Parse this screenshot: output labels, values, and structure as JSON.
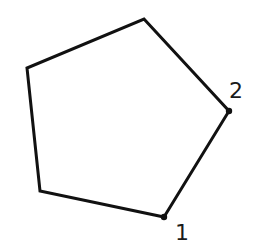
{
  "diagram": {
    "shape": "pentagon",
    "stroke_color": "#111111",
    "background": "#ffffff",
    "vertices": [
      {
        "x": 164,
        "y": 217
      },
      {
        "x": 229,
        "y": 111
      },
      {
        "x": 144,
        "y": 19
      },
      {
        "x": 27,
        "y": 68
      },
      {
        "x": 40,
        "y": 191
      }
    ],
    "labels": [
      {
        "text": "1",
        "x": 175,
        "y": 240
      },
      {
        "text": "2",
        "x": 229,
        "y": 98
      }
    ]
  }
}
